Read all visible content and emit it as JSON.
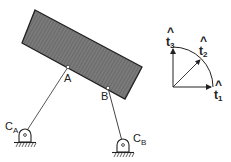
{
  "diagram": {
    "type": "four-bar-linkage",
    "body": {
      "name": "rigid block",
      "fill": "#6e6e6e",
      "corners": [
        [
          35,
          10
        ],
        [
          142,
          67
        ],
        [
          125,
          99
        ],
        [
          22,
          43
        ]
      ]
    },
    "points": {
      "A": {
        "label": "A",
        "x": 68,
        "y": 67
      },
      "B": {
        "label": "B",
        "x": 108,
        "y": 88
      }
    },
    "supports": {
      "CA": {
        "label": "C",
        "subscript": "A",
        "x": 25,
        "y": 134
      },
      "CB": {
        "label": "C",
        "subscript": "B",
        "x": 123,
        "y": 144
      }
    },
    "links": [
      {
        "from": "A",
        "to": "CA"
      },
      {
        "from": "B",
        "to": "CB"
      }
    ],
    "basis": {
      "origin": [
        173,
        87
      ],
      "vectors": [
        {
          "name": "t1",
          "label": "t",
          "subscript": "1",
          "hat": "^"
        },
        {
          "name": "t2",
          "label": "t",
          "subscript": "2",
          "hat": "^"
        },
        {
          "name": "t3",
          "label": "t",
          "subscript": "3",
          "hat": "^"
        }
      ]
    }
  }
}
